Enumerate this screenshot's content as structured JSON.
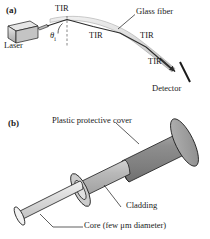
{
  "figure": {
    "panel_a": {
      "tag": "(a)",
      "labels": {
        "laser": "Laser",
        "glass_fiber": "Glass fiber",
        "detector": "Detector",
        "angle_symbol": "θ",
        "angle_subscript": "i",
        "tir_1": "TIR",
        "tir_2": "TIR",
        "tir_3": "TIR",
        "tir_4": "TIR"
      }
    },
    "panel_b": {
      "tag": "(b)",
      "labels": {
        "cover": "Plastic protective cover",
        "cladding": "Cladding",
        "core": "Core (few μm diameter)"
      }
    },
    "colors": {
      "ink": "#1a1a1a",
      "fiber_band": "#d8d8d8",
      "ray": "#2b2b2b",
      "laser_body": "#c9c9c9",
      "laser_top": "#e2e2e2",
      "cover_body": "#8b8b8b",
      "cover_end": "#a5a5a5",
      "cladding_body": "#b8b8b8",
      "cladding_end": "#cfcfcf",
      "core_body": "#dcdcdc",
      "core_end": "#efefef",
      "background": "#ffffff"
    }
  }
}
